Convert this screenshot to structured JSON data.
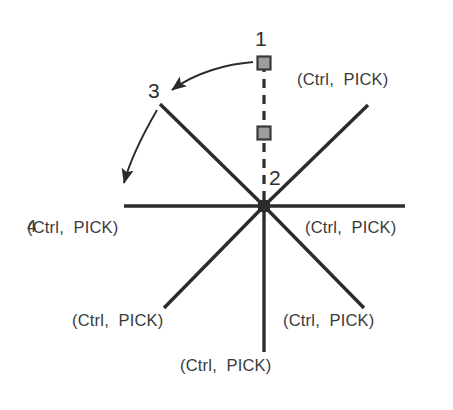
{
  "diagram": {
    "colors": {
      "line": "#2b2b2b",
      "text": "#3a3a3a",
      "grip_fill": "#9c9c9c",
      "grip_border": "#3a3a3a",
      "background": "#ffffff"
    },
    "hub": {
      "x": 264,
      "y": 206,
      "label": "2"
    },
    "callouts": [
      {
        "id": "1",
        "text": "1",
        "x": 255,
        "y": 28
      },
      {
        "id": "2",
        "text": "2",
        "x": 269,
        "y": 167
      },
      {
        "id": "3",
        "text": "3",
        "x": 148,
        "y": 80
      },
      {
        "id": "4",
        "text": "4",
        "x": 27,
        "y": 218
      }
    ],
    "pick_labels": [
      {
        "position": "top-right",
        "text": "(Ctrl,  PICK)"
      },
      {
        "position": "right",
        "text": "(Ctrl,  PICK)"
      },
      {
        "position": "bottom-right",
        "text": "(Ctrl,  PICK)"
      },
      {
        "position": "bottom",
        "text": "(Ctrl,  PICK)"
      },
      {
        "position": "bottom-left",
        "text": "(Ctrl,  PICK)"
      },
      {
        "position": "left",
        "text": "(Ctrl,  PICK)"
      }
    ],
    "spokes": [
      {
        "name": "horizontal-left",
        "x1": 124,
        "y1": 206,
        "x2": 264,
        "y2": 206
      },
      {
        "name": "horizontal-right",
        "x1": 264,
        "y1": 206,
        "x2": 405,
        "y2": 206
      },
      {
        "name": "upper-right",
        "x1": 264,
        "y1": 206,
        "x2": 368,
        "y2": 105
      },
      {
        "name": "upper-left",
        "x1": 264,
        "y1": 206,
        "x2": 160,
        "y2": 104
      },
      {
        "name": "lower-left",
        "x1": 264,
        "y1": 206,
        "x2": 164,
        "y2": 308
      },
      {
        "name": "lower-right",
        "x1": 264,
        "y1": 206,
        "x2": 364,
        "y2": 308
      },
      {
        "name": "vertical-down",
        "x1": 264,
        "y1": 206,
        "x2": 264,
        "y2": 352
      }
    ],
    "dashed_line": {
      "x1": 264,
      "y1": 63,
      "x2": 264,
      "y2": 206
    },
    "grips": [
      {
        "name": "grip-top",
        "x": 264,
        "y": 63,
        "size": 13
      },
      {
        "name": "grip-middle",
        "x": 264,
        "y": 133,
        "size": 13
      }
    ],
    "arrows": [
      {
        "name": "arrow-1-to-3",
        "path": "M 253 62 C 228 64, 196 72, 172 90",
        "tip": {
          "x": 168,
          "y": 93
        }
      },
      {
        "name": "arrow-3-to-4",
        "path": "M 157 110 C 142 136, 130 160, 124 183",
        "tip": {
          "x": 122,
          "y": 190
        }
      }
    ]
  }
}
